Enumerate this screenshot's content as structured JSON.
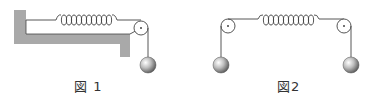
{
  "figures": [
    {
      "id": "fig1",
      "caption": "図 1",
      "elements": [
        "wall-table",
        "spring",
        "pulley",
        "string",
        "ball"
      ],
      "spring_coils": 10
    },
    {
      "id": "fig2",
      "caption": "図2",
      "elements": [
        "left-pulley",
        "spring",
        "right-pulley",
        "left-ball",
        "right-ball"
      ],
      "spring_coils": 10
    }
  ],
  "colors": {
    "table": "#a8a8a8",
    "line": "#444444",
    "ball_light": "#f5f5f5",
    "ball_dark": "#5a5a5a"
  }
}
